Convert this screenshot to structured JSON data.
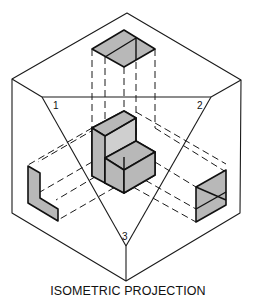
{
  "caption": "ISOMETRIC PROJECTION",
  "labels": {
    "plane_1": "1",
    "plane_2": "2",
    "plane_3": "3"
  },
  "colors": {
    "line": "#1a1a1a",
    "face_shade": "#b8b8b8",
    "background": "#ffffff"
  },
  "diagram": {
    "type": "isometric projection of an L-shaped block onto three principal planes",
    "views": [
      "top view",
      "left side view",
      "right side view"
    ]
  }
}
